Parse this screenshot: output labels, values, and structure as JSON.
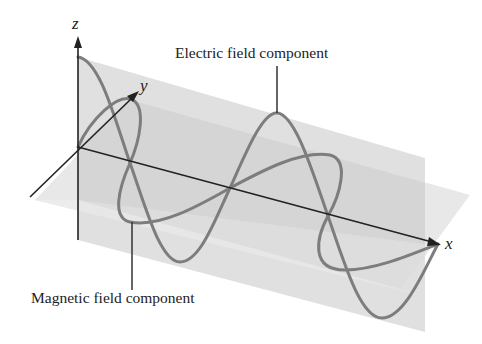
{
  "diagram": {
    "type": "electromagnetic-wave-3d",
    "axes": {
      "x": "x",
      "y": "y",
      "z": "z"
    },
    "labels": {
      "electric": "Electric field component",
      "magnetic": "Magnetic field component"
    },
    "colors": {
      "background": "#ffffff",
      "vertical_plane": "#d9d9d9",
      "horizontal_plane": "#e6e6e6",
      "overlap": "#cfcfcf",
      "wave": "#7a7a7a",
      "axis": "#222222"
    }
  }
}
